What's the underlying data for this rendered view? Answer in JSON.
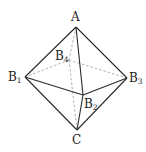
{
  "diagram": {
    "type": "octahedron",
    "vertices": {
      "A": {
        "label": "A",
        "sub": ""
      },
      "B1": {
        "label": "B",
        "sub": "1"
      },
      "B2": {
        "label": "B",
        "sub": "2"
      },
      "B3": {
        "label": "B",
        "sub": "3"
      },
      "B4": {
        "label": "B",
        "sub": "4"
      },
      "C": {
        "label": "C",
        "sub": ""
      }
    },
    "solid_edges": [
      [
        "A",
        "B1"
      ],
      [
        "A",
        "B2"
      ],
      [
        "A",
        "B3"
      ],
      [
        "B1",
        "B2"
      ],
      [
        "B2",
        "B3"
      ],
      [
        "B1",
        "C"
      ],
      [
        "B2",
        "C"
      ],
      [
        "B3",
        "C"
      ]
    ],
    "dashed_edges": [
      [
        "A",
        "B4"
      ],
      [
        "B4",
        "C"
      ],
      [
        "B4",
        "B1"
      ],
      [
        "B4",
        "B3"
      ]
    ]
  }
}
